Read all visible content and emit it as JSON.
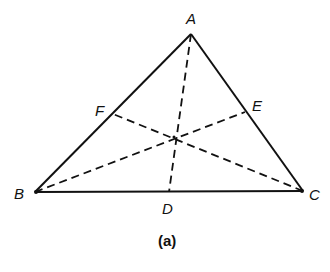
{
  "diagram": {
    "caption": "(a)",
    "colors": {
      "stroke": "#111111",
      "background": "#ffffff"
    },
    "vertices": {
      "A": {
        "label": "A",
        "x": 191,
        "y": 34
      },
      "B": {
        "label": "B",
        "x": 35,
        "y": 192
      },
      "C": {
        "label": "C",
        "x": 303,
        "y": 191
      }
    },
    "midpoints": {
      "D": {
        "label": "D",
        "x": 169,
        "y": 192
      },
      "E": {
        "label": "E",
        "x": 245,
        "y": 112
      },
      "F": {
        "label": "F",
        "x": 113,
        "y": 114
      }
    },
    "centroid": {
      "x": 174,
      "y": 137
    },
    "edges": [
      {
        "from": "A",
        "to": "B",
        "style": "solid"
      },
      {
        "from": "B",
        "to": "C",
        "style": "solid"
      },
      {
        "from": "C",
        "to": "A",
        "style": "solid"
      }
    ],
    "medians": [
      {
        "from": "A",
        "to": "D",
        "style": "dashed"
      },
      {
        "from": "B",
        "to": "E",
        "style": "dashed"
      },
      {
        "from": "C",
        "to": "F",
        "style": "dashed"
      }
    ]
  }
}
